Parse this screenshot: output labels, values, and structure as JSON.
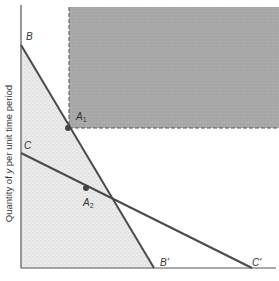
{
  "diagram": {
    "type": "budget-constraint-diagram",
    "y_axis_label": {
      "prefix": "Quantity of ",
      "variable": "y",
      "suffix": " per unit time period"
    },
    "x_axis_label": "",
    "lines": [
      {
        "name": "BB'",
        "start_label": "B",
        "end_label": "B'",
        "start": [
          21,
          45
        ],
        "end": [
          154,
          268
        ]
      },
      {
        "name": "CC'",
        "start_label": "C",
        "end_label": "C'",
        "start": [
          21,
          153
        ],
        "end": [
          252,
          268
        ]
      }
    ],
    "points": [
      {
        "label": "A",
        "subscript": "1",
        "pos": [
          68,
          128
        ]
      },
      {
        "label": "A",
        "subscript": "2",
        "pos": [
          86,
          188
        ]
      }
    ],
    "regions": [
      {
        "name": "feasible-set-stippled",
        "fill": "#e4e4e4",
        "polygon": [
          [
            21,
            45
          ],
          [
            21,
            268
          ],
          [
            154,
            268
          ]
        ]
      },
      {
        "name": "preferred-set-shaded",
        "fill": "#a8a8a8",
        "rect": [
          69,
          7,
          279,
          128
        ],
        "dashed_edges": [
          "left",
          "bottom"
        ]
      }
    ],
    "colors": {
      "axis": "#555555",
      "line": "#4a4a4a",
      "point": "#444444",
      "dark_region": "#a8a8a8",
      "light_region": "#e4e4e4",
      "dash": "#555555"
    }
  },
  "labels": {
    "B": "B",
    "B_prime": "B'",
    "C": "C",
    "C_prime": "C'",
    "A1_main": "A",
    "A1_sub": "1",
    "A2_main": "A",
    "A2_sub": "2"
  }
}
